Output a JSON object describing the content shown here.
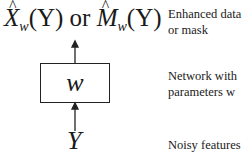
{
  "diagram": {
    "output": {
      "x_symbol": "X",
      "m_symbol": "M",
      "subscript": "w",
      "arg": "(Y)",
      "connector": "or"
    },
    "network_box": {
      "label": "w"
    },
    "input": {
      "label": "Y"
    },
    "annotations": [
      {
        "line1": "Enhanced data",
        "line2": "or mask"
      },
      {
        "line1": "Network with",
        "line2": "parameters w"
      },
      {
        "line1": "Noisy features"
      }
    ],
    "colors": {
      "stroke": "#222222",
      "text": "#1a1a1a",
      "background": "#ffffff"
    }
  }
}
